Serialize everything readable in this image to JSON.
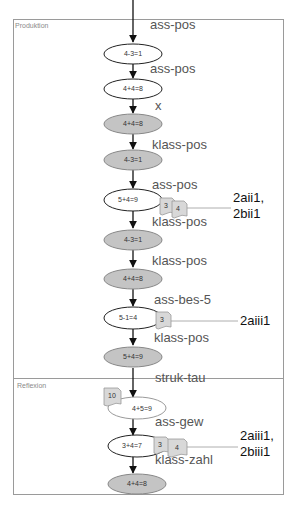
{
  "sections": [
    {
      "title": "Produktion"
    },
    {
      "title": "Reflexion"
    }
  ],
  "nodes": [
    {
      "label": "4-3=1",
      "style": "white"
    },
    {
      "label": "4+4=8",
      "style": "white"
    },
    {
      "label": "4+4=8",
      "style": "gray"
    },
    {
      "label": "4-3=1",
      "style": "gray"
    },
    {
      "label": "5+4=9",
      "style": "white"
    },
    {
      "label": "4-3=1",
      "style": "gray"
    },
    {
      "label": "4+4=8",
      "style": "gray"
    },
    {
      "label": "5-1=4",
      "style": "white"
    },
    {
      "label": "5+4=9",
      "style": "gray"
    },
    {
      "label": "4+5=9",
      "style": "light"
    },
    {
      "label": "3+4=7",
      "style": "white"
    },
    {
      "label": "4+4=8",
      "style": "gray"
    }
  ],
  "edge_labels": [
    "ass-pos",
    "ass-pos",
    "x",
    "klass-pos",
    "ass-pos",
    "klass-pos",
    "klass-pos",
    "ass-bes-5",
    "klass-pos",
    "struk-tau",
    "ass-gew",
    "klass-zahl"
  ],
  "notes": [
    {
      "label": "3"
    },
    {
      "label": "4"
    },
    {
      "label": "3"
    },
    {
      "label": "10"
    },
    {
      "label": "3"
    },
    {
      "label": "4"
    }
  ],
  "references": [
    {
      "lines": [
        "2aii1,",
        "2bii1"
      ]
    },
    {
      "lines": [
        "2aiii1"
      ]
    },
    {
      "lines": [
        "2aiii1,",
        "2biii1"
      ]
    }
  ],
  "colors": {
    "node_gray": "#c4c4c4",
    "note_fill": "#d8d8d8",
    "frame": "#9a9a9a"
  }
}
